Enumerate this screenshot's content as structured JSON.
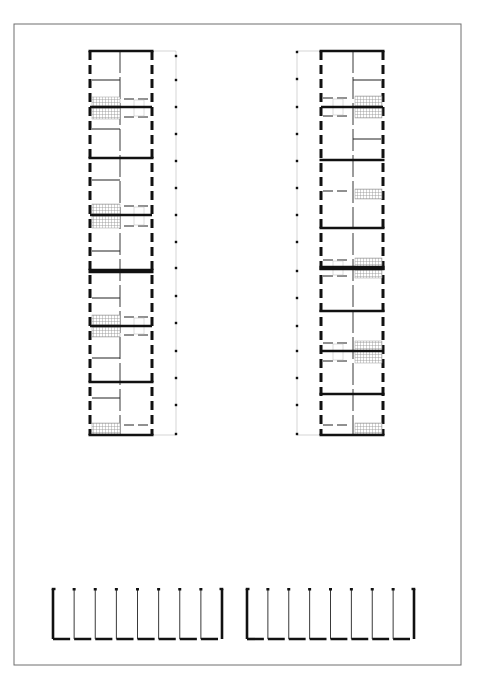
{
  "sheet": {
    "width": 477,
    "height": 680,
    "frame": {
      "x": 14,
      "y": 24,
      "w": 447,
      "h": 641,
      "stroke": "#6e6e6e"
    },
    "colors": {
      "wall": "#111111",
      "thin": "#222222",
      "faint": "#b8b8b8",
      "hatch": "#9a9a9a"
    }
  },
  "blocks": [
    {
      "id": "left-block",
      "x": 90,
      "y": 51,
      "w": 62,
      "h": 384,
      "spine_x": 120,
      "corridor_side": "right",
      "corridor_x": 176,
      "walls_y": [
        51,
        158,
        271,
        382,
        435
      ],
      "heavy_walls_y": [
        271
      ],
      "partitions": [
        {
          "y": 80,
          "x1": 92,
          "x2": 120
        },
        {
          "y": 129,
          "x1": 92,
          "x2": 120
        },
        {
          "y": 180,
          "x1": 92,
          "x2": 120
        },
        {
          "y": 251,
          "x1": 92,
          "x2": 120
        },
        {
          "y": 298,
          "x1": 92,
          "x2": 120
        },
        {
          "y": 358,
          "x1": 92,
          "x2": 120
        },
        {
          "y": 398,
          "x1": 92,
          "x2": 120
        }
      ],
      "stairs": [
        {
          "y": 97,
          "h": 22,
          "x": 92,
          "w": 28,
          "mid": 107
        },
        {
          "y": 204,
          "h": 24,
          "x": 92,
          "w": 28,
          "mid": 215
        },
        {
          "y": 315,
          "h": 22,
          "x": 92,
          "w": 28,
          "mid": 326
        },
        {
          "y": 423,
          "h": 11,
          "x": 92,
          "w": 28,
          "mid": 0
        }
      ],
      "corridor_dots_y": [
        56,
        80,
        107,
        134,
        161,
        188,
        215,
        242,
        268,
        296,
        323,
        351,
        378,
        405,
        434
      ]
    },
    {
      "id": "right-block",
      "x": 321,
      "y": 51,
      "w": 62,
      "h": 384,
      "spine_x": 353,
      "corridor_side": "left",
      "corridor_x": 297,
      "walls_y": [
        51,
        160,
        228,
        268,
        311,
        394,
        435
      ],
      "heavy_walls_y": [
        268
      ],
      "partitions": [
        {
          "y": 80,
          "x1": 353,
          "x2": 381
        },
        {
          "y": 139,
          "x1": 353,
          "x2": 381
        }
      ],
      "stairs": [
        {
          "y": 96,
          "h": 22,
          "x": 355,
          "w": 27,
          "mid": 107
        },
        {
          "y": 189,
          "h": 10,
          "x": 355,
          "w": 27,
          "mid": 0
        },
        {
          "y": 258,
          "h": 20,
          "x": 355,
          "w": 27,
          "mid": 268
        },
        {
          "y": 341,
          "h": 22,
          "x": 355,
          "w": 27,
          "mid": 351
        },
        {
          "y": 423,
          "h": 11,
          "x": 355,
          "w": 27,
          "mid": 0
        }
      ],
      "corridor_dots_y": [
        52,
        79,
        107,
        134,
        161,
        188,
        215,
        242,
        271,
        298,
        326,
        351,
        378,
        405,
        434
      ]
    }
  ],
  "garages": [
    {
      "id": "garage-row-left",
      "x": 53,
      "y": 589,
      "w": 169,
      "h": 50,
      "bays": 8,
      "open_top": true
    },
    {
      "id": "garage-row-right",
      "x": 247,
      "y": 589,
      "w": 167,
      "h": 50,
      "bays": 8,
      "open_top": true
    }
  ]
}
